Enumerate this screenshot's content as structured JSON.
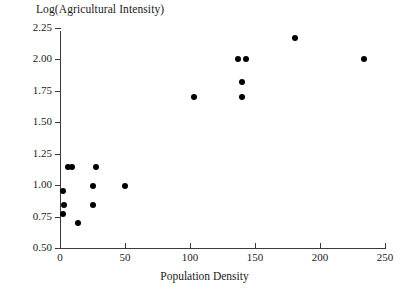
{
  "chart_data": {
    "type": "scatter",
    "title": "",
    "ylabel": "Log(Agricultural Intensity)",
    "xlabel": "Population Density",
    "xlim": [
      -8,
      258
    ],
    "ylim": [
      0.5,
      2.3
    ],
    "xticks": [
      0,
      50,
      100,
      150,
      200,
      250
    ],
    "xtick_labels": [
      "0",
      "50",
      "100",
      "150",
      "200",
      "250"
    ],
    "yticks": [
      0.5,
      0.75,
      1.0,
      1.25,
      1.5,
      1.75,
      2.0,
      2.25
    ],
    "ytick_labels": [
      "0.50",
      "0.75",
      "1.00",
      "1.25",
      "1.50",
      "1.75",
      "2.00",
      "2.25"
    ],
    "grid": false,
    "legend": null,
    "marker": {
      "shape": "circle",
      "color": "#000000",
      "size_px": 6
    },
    "points": [
      {
        "x": 2,
        "y": 0.77
      },
      {
        "x": 3,
        "y": 0.84
      },
      {
        "x": 2,
        "y": 0.95
      },
      {
        "x": 6,
        "y": 1.14
      },
      {
        "x": 9,
        "y": 1.14
      },
      {
        "x": 14,
        "y": 0.7
      },
      {
        "x": 25,
        "y": 0.84
      },
      {
        "x": 25,
        "y": 0.99
      },
      {
        "x": 28,
        "y": 1.14
      },
      {
        "x": 50,
        "y": 0.99
      },
      {
        "x": 103,
        "y": 1.7
      },
      {
        "x": 137,
        "y": 2.0
      },
      {
        "x": 143,
        "y": 2.0
      },
      {
        "x": 140,
        "y": 1.82
      },
      {
        "x": 140,
        "y": 1.7
      },
      {
        "x": 181,
        "y": 2.17
      },
      {
        "x": 234,
        "y": 2.0
      }
    ]
  }
}
